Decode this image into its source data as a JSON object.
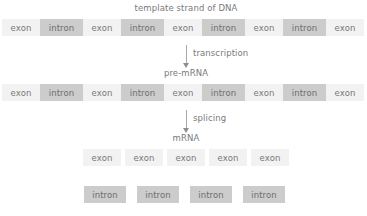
{
  "diagram": {
    "title_row1": "template strand of DNA",
    "title_row2": "pre-mRNA",
    "title_row3": "mRNA",
    "arrow1_label": "transcription",
    "arrow2_label": "splicing",
    "labels": {
      "exon": "exon",
      "intron": "intron"
    },
    "colors": {
      "exon_fill": "#f2f2f2",
      "intron_fill": "#cccccc",
      "text": "#7a7a7a",
      "arrow": "#a8a8a8",
      "background": "#ffffff"
    },
    "rows": {
      "dna": {
        "name": "template strand of DNA",
        "segments": [
          "exon",
          "intron",
          "exon",
          "intron",
          "exon",
          "intron",
          "exon",
          "intron",
          "exon"
        ]
      },
      "pre_mrna": {
        "name": "pre-mRNA",
        "segments": [
          "exon",
          "intron",
          "exon",
          "intron",
          "exon",
          "intron",
          "exon",
          "intron",
          "exon"
        ]
      },
      "mrna": {
        "name": "mRNA",
        "segments": [
          "exon",
          "exon",
          "exon",
          "exon",
          "exon"
        ]
      },
      "excised_introns": {
        "name": "excised introns",
        "segments": [
          "intron",
          "intron",
          "intron",
          "intron"
        ]
      }
    }
  }
}
